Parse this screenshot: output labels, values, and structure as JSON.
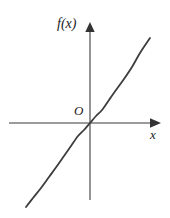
{
  "figure": {
    "background_color": "#ffffff",
    "width": 170,
    "height": 218
  },
  "labels": {
    "y_axis": "f(x)",
    "x_axis": "x",
    "origin": "O"
  },
  "style": {
    "axis_color": "#7a7a7a",
    "arrow_color": "#333333",
    "curve_color": "#3d3d3d",
    "text_color": "#1a1a1a",
    "axis_width": 1.6,
    "curve_width": 1.8
  },
  "chart_data": {
    "type": "line",
    "title": "",
    "xlabel": "x",
    "ylabel": "f(x)",
    "legend": [],
    "grid": false,
    "axes": {
      "origin_label": "O",
      "origin_px": [
        90,
        123
      ],
      "x_axis_px": {
        "start": [
          9,
          123
        ],
        "end": [
          160,
          123
        ],
        "arrow": "right"
      },
      "y_axis_px": {
        "start": [
          90,
          200
        ],
        "end": [
          90,
          23
        ],
        "arrow": "up"
      },
      "xlim": [
        -2.2,
        2.4
      ],
      "ylim": [
        -2.6,
        3.2
      ],
      "ticks": []
    },
    "series": [
      {
        "name": "f(x)",
        "description": "odd increasing cubic-like curve through the origin",
        "x": [
          -2.0,
          -1.75,
          -1.5,
          -1.25,
          -1.0,
          -0.75,
          -0.5,
          -0.25,
          0.0,
          0.25,
          0.5,
          0.75,
          1.0,
          1.25,
          1.5,
          1.75,
          2.0
        ],
        "y": [
          -2.6,
          -2.05,
          -1.55,
          -1.12,
          -0.78,
          -0.5,
          -0.29,
          -0.13,
          0.0,
          0.13,
          0.29,
          0.5,
          0.78,
          1.12,
          1.55,
          2.05,
          2.6
        ],
        "points_px": [
          [
            26,
            207
          ],
          [
            33,
            198
          ],
          [
            41,
            188
          ],
          [
            49,
            177
          ],
          [
            57,
            166
          ],
          [
            64,
            156
          ],
          [
            71,
            146
          ],
          [
            78,
            136
          ],
          [
            84,
            130
          ],
          [
            90,
            123
          ],
          [
            96,
            116
          ],
          [
            102,
            110
          ],
          [
            109,
            100
          ],
          [
            116,
            90
          ],
          [
            124,
            79
          ],
          [
            132,
            67
          ],
          [
            140,
            53
          ],
          [
            150,
            38
          ]
        ]
      }
    ]
  }
}
